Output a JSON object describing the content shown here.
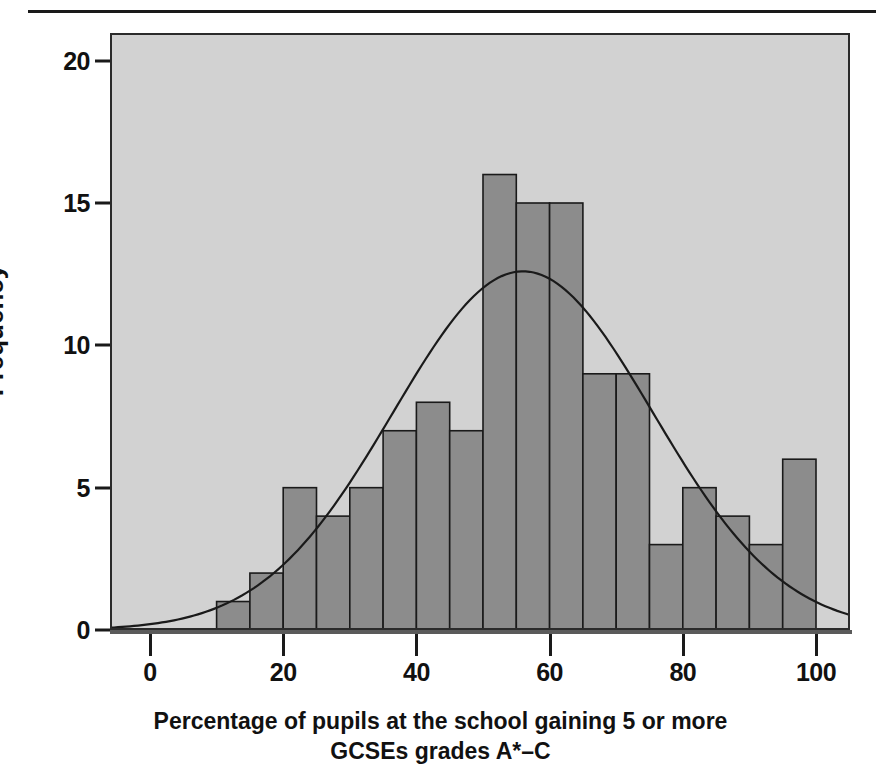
{
  "figure": {
    "type": "histogram-with-normal-curve",
    "axis_title_x_line1": "Percentage of pupils at the school gaining 5 or more",
    "axis_title_x_line2": "GCSEs grades A*–C",
    "axis_title_y": "Frequency"
  },
  "chart_data": {
    "type": "bar",
    "title": "",
    "xlabel": "Percentage of pupils at the school gaining 5 or more GCSEs grades A*–C",
    "ylabel": "Frequency",
    "xlim": [
      -6,
      106
    ],
    "ylim": [
      0,
      21
    ],
    "xticks": [
      0,
      20,
      40,
      60,
      80,
      100
    ],
    "xtick_labels": [
      "0",
      "20",
      "40",
      "60",
      "80",
      "100"
    ],
    "yticks": [
      0,
      5,
      10,
      15,
      20
    ],
    "ytick_labels": [
      "0",
      "5",
      "10",
      "15",
      "20"
    ],
    "grid": false,
    "legend": null,
    "bin_width": 5,
    "bin_starts": [
      10,
      15,
      20,
      25,
      30,
      35,
      40,
      45,
      50,
      55,
      60,
      65,
      70,
      75,
      80,
      85,
      90,
      95
    ],
    "categories": [
      "10–15",
      "15–20",
      "20–25",
      "25–30",
      "30–35",
      "35–40",
      "40–45",
      "45–50",
      "50–55",
      "55–60",
      "60–65",
      "65–70",
      "70–75",
      "75–80",
      "80–85",
      "85–90",
      "90–95",
      "95–100"
    ],
    "values": [
      1,
      2,
      5,
      4,
      5,
      7,
      8,
      7,
      16,
      15,
      15,
      9,
      9,
      3,
      5,
      4,
      3,
      6
    ],
    "overlay": {
      "type": "line",
      "name": "normal curve",
      "mean": 56,
      "sigma": 19.5,
      "peak": 12.6
    },
    "colors": {
      "bar_fill": "#8c8c8c",
      "bar_edge": "#1a1a1a",
      "panel_bg": "#d2d2d2",
      "curve": "#1a1a1a",
      "text": "#111111"
    }
  }
}
